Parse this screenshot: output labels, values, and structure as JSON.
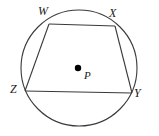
{
  "figure": {
    "background_color": "#ffffff",
    "stroke_color": "#3a3a3a",
    "center_dot_color": "#000000",
    "label_color": "#1a1a1a",
    "circle": {
      "name": "circle-P",
      "center_x": 79,
      "center_y": 68,
      "radius": 58
    },
    "center_point": {
      "label": "P",
      "x": 78,
      "y": 68,
      "dot_radius": 3.2
    },
    "vertices": [
      {
        "label": "W",
        "x": 49,
        "y": 24
      },
      {
        "label": "X",
        "x": 115,
        "y": 26
      },
      {
        "label": "Y",
        "x": 132,
        "y": 93
      },
      {
        "label": "Z",
        "x": 25,
        "y": 91
      }
    ],
    "edges": [
      {
        "name": "segment-WX",
        "from": "W",
        "to": "X"
      },
      {
        "name": "segment-XY",
        "from": "X",
        "to": "Y"
      },
      {
        "name": "segment-YZ",
        "from": "Y",
        "to": "Z"
      },
      {
        "name": "segment-ZW",
        "from": "Z",
        "to": "W"
      }
    ]
  }
}
